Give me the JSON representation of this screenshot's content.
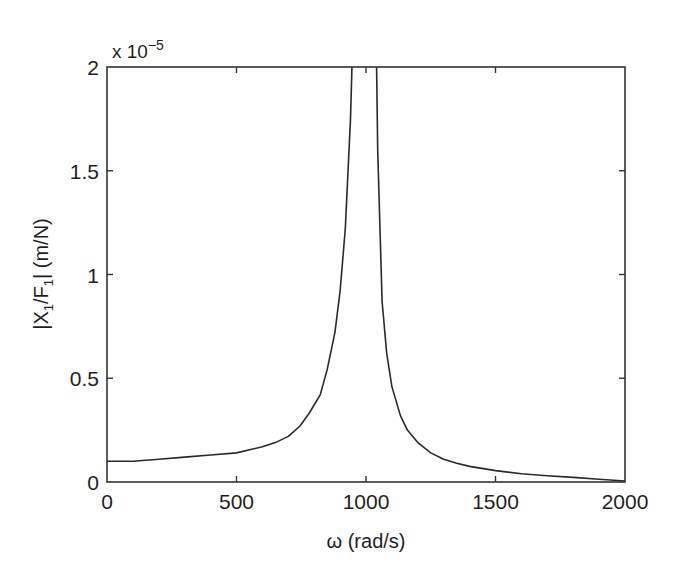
{
  "chart_data": {
    "type": "line",
    "title": "",
    "xlabel": "ω (rad/s)",
    "ylabel": "|X1/F1| (m/N)",
    "ylabel_parts": {
      "pre": "|X",
      "sub1": "1",
      "mid": "/F",
      "sub2": "1",
      "post": "| (m/N)"
    },
    "y_multiplier": {
      "text": "x 10",
      "exponent": "−5"
    },
    "xlim": [
      0,
      2000
    ],
    "ylim": [
      0,
      2
    ],
    "y_units_scale": 1e-05,
    "grid": false,
    "legend": null,
    "x_ticks": [
      0,
      500,
      1000,
      1500,
      2000
    ],
    "x_tick_labels": [
      "0",
      "500",
      "1000",
      "1500",
      "2000"
    ],
    "y_ticks": [
      0,
      0.5,
      1,
      1.5,
      2
    ],
    "y_tick_labels": [
      "0",
      "0.5",
      "1",
      "1.5",
      "2"
    ],
    "series": [
      {
        "name": "|X1/F1|",
        "color": "#2a2a2a",
        "x": [
          0,
          100,
          200,
          300,
          400,
          500,
          600,
          650,
          700,
          745,
          780,
          823,
          850,
          880,
          900,
          920,
          940,
          955,
          970,
          985,
          1000,
          1015,
          1030,
          1045,
          1062,
          1080,
          1100,
          1133,
          1160,
          1200,
          1250,
          1300,
          1350,
          1400,
          1500,
          1600,
          1700,
          1800,
          1900,
          2000
        ],
        "values": [
          0.1,
          0.1,
          0.11,
          0.12,
          0.13,
          0.14,
          0.17,
          0.19,
          0.22,
          0.27,
          0.33,
          0.42,
          0.54,
          0.72,
          0.92,
          1.22,
          1.75,
          2.4,
          4.0,
          9.0,
          50.0,
          9.0,
          3.2,
          1.6,
          0.87,
          0.62,
          0.46,
          0.32,
          0.25,
          0.19,
          0.14,
          0.11,
          0.09,
          0.075,
          0.055,
          0.04,
          0.03,
          0.022,
          0.013,
          0.005
        ]
      }
    ]
  }
}
